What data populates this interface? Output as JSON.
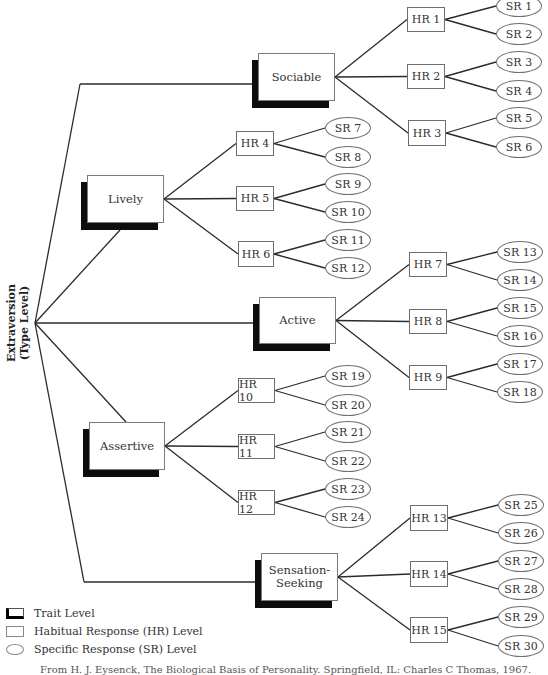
{
  "root": {
    "label_line1": "Extraversion",
    "label_line2": "(Type Level)",
    "anchor": [
      35,
      323
    ]
  },
  "traits": [
    {
      "id": "sociable",
      "label": "Sociable",
      "box": [
        258,
        53,
        77,
        48
      ],
      "join": [
        252,
        84
      ],
      "rootJoin": [
        80,
        84
      ],
      "hrs": [
        {
          "label": "HR 1",
          "box": [
            407,
            7,
            38,
            25
          ],
          "srs": [
            {
              "label": "SR 1",
              "c": [
                519,
                6
              ]
            },
            {
              "label": "SR 2",
              "c": [
                519,
                34
              ]
            }
          ]
        },
        {
          "label": "HR 2",
          "box": [
            407,
            64,
            38,
            25
          ],
          "srs": [
            {
              "label": "SR 3",
              "c": [
                519,
                62
              ]
            },
            {
              "label": "SR 4",
              "c": [
                519,
                91
              ]
            }
          ]
        },
        {
          "label": "HR 3",
          "box": [
            408,
            120,
            38,
            26
          ],
          "srs": [
            {
              "label": "SR 5",
              "c": [
                519,
                118
              ]
            },
            {
              "label": "SR 6",
              "c": [
                519,
                147
              ]
            }
          ]
        }
      ]
    },
    {
      "id": "lively",
      "label": "Lively",
      "box": [
        87,
        175,
        77,
        48
      ],
      "join": [
        120,
        230
      ],
      "rootJoin": null,
      "hrs": [
        {
          "label": "HR 4",
          "box": [
            236,
            131,
            38,
            25
          ],
          "srs": [
            {
              "label": "SR 7",
              "c": [
                348,
                128
              ]
            },
            {
              "label": "SR 8",
              "c": [
                348,
                157
              ]
            }
          ]
        },
        {
          "label": "HR 5",
          "box": [
            236,
            186,
            38,
            25
          ],
          "srs": [
            {
              "label": "SR 9",
              "c": [
                348,
                184
              ]
            },
            {
              "label": "SR 10",
              "c": [
                348,
                212
              ]
            }
          ]
        },
        {
          "label": "HR 6",
          "box": [
            238,
            241,
            36,
            26
          ],
          "srs": [
            {
              "label": "SR 11",
              "c": [
                348,
                240
              ]
            },
            {
              "label": "SR 12",
              "c": [
                348,
                268
              ]
            }
          ]
        }
      ]
    },
    {
      "id": "active",
      "label": "Active",
      "box": [
        259,
        297,
        77,
        47
      ],
      "join": [
        253,
        323
      ],
      "rootJoin": null,
      "hrs": [
        {
          "label": "HR 7",
          "box": [
            409,
            252,
            38,
            25
          ],
          "srs": [
            {
              "label": "SR 13",
              "c": [
                520,
                252
              ]
            },
            {
              "label": "SR 14",
              "c": [
                520,
                280
              ]
            }
          ]
        },
        {
          "label": "HR 8",
          "box": [
            409,
            309,
            38,
            25
          ],
          "srs": [
            {
              "label": "SR 15",
              "c": [
                520,
                308
              ]
            },
            {
              "label": "SR 16",
              "c": [
                520,
                336
              ]
            }
          ]
        },
        {
          "label": "HR 9",
          "box": [
            409,
            365,
            38,
            25
          ],
          "srs": [
            {
              "label": "SR 17",
              "c": [
                520,
                364
              ]
            },
            {
              "label": "SR 18",
              "c": [
                520,
                392
              ]
            }
          ]
        }
      ]
    },
    {
      "id": "assertive",
      "label": "Assertive",
      "box": [
        89,
        422,
        76,
        48
      ],
      "join": [
        126,
        422
      ],
      "rootJoin": null,
      "hrs": [
        {
          "label": "HR 10",
          "box": [
            238,
            378,
            37,
            25
          ],
          "srs": [
            {
              "label": "SR 19",
              "c": [
                348,
                376
              ]
            },
            {
              "label": "SR 20",
              "c": [
                348,
                405
              ]
            }
          ]
        },
        {
          "label": "HR 11",
          "box": [
            238,
            434,
            37,
            25
          ],
          "srs": [
            {
              "label": "SR 21",
              "c": [
                348,
                432
              ]
            },
            {
              "label": "SR 22",
              "c": [
                348,
                461
              ]
            }
          ]
        },
        {
          "label": "HR 12",
          "box": [
            238,
            490,
            37,
            25
          ],
          "srs": [
            {
              "label": "SR 23",
              "c": [
                348,
                489
              ]
            },
            {
              "label": "SR 24",
              "c": [
                348,
                517
              ]
            }
          ]
        }
      ]
    },
    {
      "id": "sensation-seeking",
      "label_line1": "Sensation-",
      "label_line2": "Seeking",
      "label": "Sensation-Seeking",
      "box": [
        261,
        553,
        77,
        48
      ],
      "join": [
        255,
        582
      ],
      "rootJoin": [
        84,
        582
      ],
      "hrs": [
        {
          "label": "HR 13",
          "box": [
            410,
            505,
            38,
            26
          ],
          "srs": [
            {
              "label": "SR 25",
              "c": [
                521,
                505
              ]
            },
            {
              "label": "SR 26",
              "c": [
                521,
                533
              ]
            }
          ]
        },
        {
          "label": "HR 14",
          "box": [
            410,
            561,
            38,
            26
          ],
          "srs": [
            {
              "label": "SR 27",
              "c": [
                521,
                561
              ]
            },
            {
              "label": "SR 28",
              "c": [
                521,
                589
              ]
            }
          ]
        },
        {
          "label": "HR 15",
          "box": [
            410,
            617,
            38,
            26
          ],
          "srs": [
            {
              "label": "SR 29",
              "c": [
                521,
                617
              ]
            },
            {
              "label": "SR 30",
              "c": [
                521,
                646
              ]
            }
          ]
        }
      ]
    }
  ],
  "legend": {
    "trait": "Trait Level",
    "hr": "Habitual Response (HR) Level",
    "sr": "Specific Response (SR) Level"
  },
  "caption": "From H. J. Eysenck, The Biological Basis of Personality. Springfield, IL: Charles C Thomas, 1967.",
  "colors": {
    "line": "#2b2b2b",
    "shadow": "#0d0d0d",
    "border": "#6e6e6e"
  }
}
